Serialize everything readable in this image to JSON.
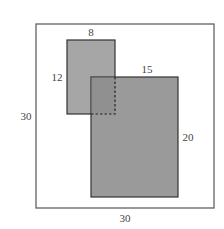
{
  "diagram": {
    "outer_square": {
      "width_label": "30",
      "height_label": "30"
    },
    "small_rectangle": {
      "width_label": "8",
      "height_label": "12"
    },
    "large_rectangle": {
      "width_label": "15",
      "height_label": "20"
    },
    "colors": {
      "outer_fill": "#ffffff",
      "small_fill": "#a6a6a6",
      "large_fill": "#9a9a9a",
      "overlap_fill": "#909090",
      "stroke": "#333333"
    }
  }
}
